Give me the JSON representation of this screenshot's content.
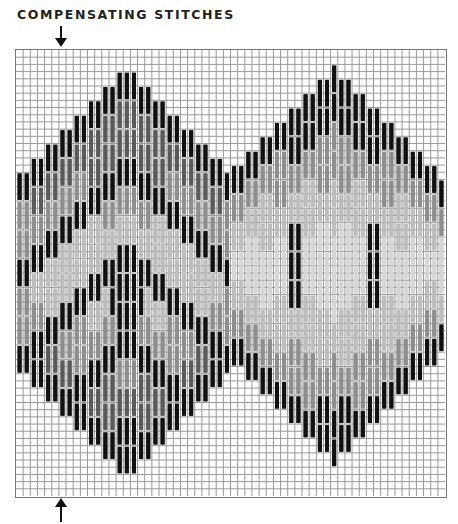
{
  "title": "COMPENSATING STITCHES",
  "arrows": {
    "top": {
      "icon": "arrow-down-icon",
      "column": 6
    },
    "bottom": {
      "icon": "arrow-up-icon",
      "column": 6
    }
  },
  "grid": {
    "columns": 60,
    "rows": 62,
    "line_color": "#9a9a9a",
    "border_color": "#777777",
    "stitch_length_rows": 4
  },
  "palette": {
    "black": "#111111",
    "dark": "#5a5a5a",
    "mid": "#8e8e8e",
    "light": "#bdbdbd",
    "pale": "#d6d6d6"
  },
  "motifs": [
    {
      "name": "left-medallion",
      "center_column": 15,
      "peak_row": 1,
      "bottom_row": 61,
      "half_width": 15
    },
    {
      "name": "right-medallion",
      "center_column": 44,
      "peak_row": 1,
      "bottom_row": 60,
      "half_width": 15
    }
  ]
}
